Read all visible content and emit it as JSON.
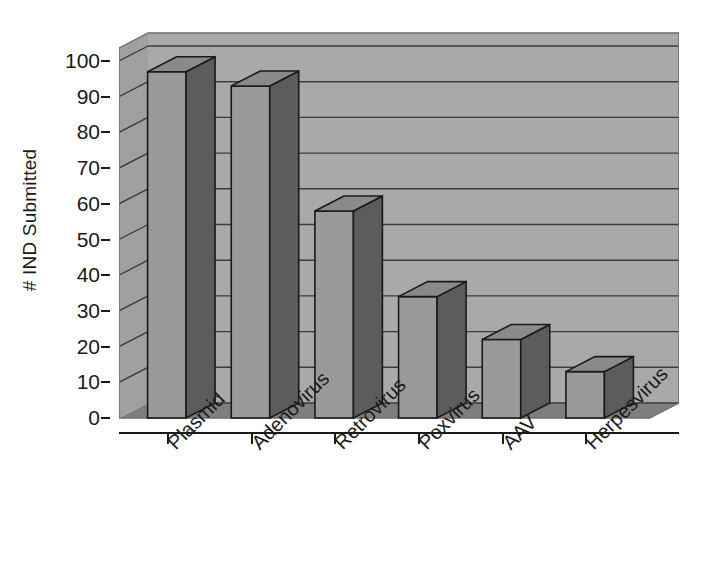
{
  "chart_data": {
    "type": "bar",
    "title": "",
    "subtitle": "",
    "xlabel": "",
    "ylabel": "# IND Submitted",
    "categories": [
      "Plasmid",
      "Adenovirus",
      "Retrovirus",
      "Poxvirus",
      "AAV",
      "Herpesvirus"
    ],
    "values": [
      97,
      93,
      58,
      34,
      22,
      13
    ],
    "series": [
      {
        "name": "# IND Submitted",
        "values": [
          97,
          93,
          58,
          34,
          22,
          13
        ]
      }
    ],
    "ylim": [
      0,
      100
    ],
    "ytick_step": 10,
    "yticks": [
      0,
      10,
      20,
      30,
      40,
      50,
      60,
      70,
      80,
      90,
      100
    ],
    "ytick_labels": [
      "0",
      "10",
      "20",
      "30",
      "40",
      "50",
      "60",
      "70",
      "80",
      "90",
      "100"
    ],
    "grid": true,
    "grid_axis": "y",
    "legend": false,
    "legend_position": "none",
    "style": "3d-column",
    "annotations": [],
    "colors": {
      "bar_front": "#9a9a9a",
      "bar_side": "#5c5c5c",
      "bar_top": "#8a8a8a",
      "bar_outline": "#1a1a1a",
      "wall_back": "#a9a9a9",
      "wall_side": "#a0a0a0",
      "floor": "#7e7e7e",
      "gridline": "#3c3c3c",
      "axis": "#1a1a1a",
      "background": "#ffffff",
      "text": "#1a1a1a"
    }
  }
}
